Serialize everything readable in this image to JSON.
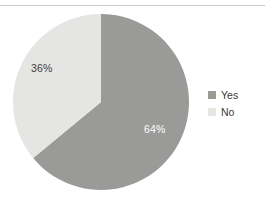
{
  "chart_data": {
    "type": "pie",
    "title": "",
    "subtitle": "",
    "xlabel": "",
    "ylabel": "",
    "grid": false,
    "legend_position": "right",
    "categories": [
      "Yes",
      "No"
    ],
    "values": [
      64,
      36
    ],
    "value_unit": "%",
    "start_angle_deg": 0,
    "direction": "clockwise",
    "slices": [
      {
        "name": "Yes",
        "value": 64,
        "label": "64%",
        "color": "#9a9a98",
        "label_color": "#ffffff"
      },
      {
        "name": "No",
        "value": 36,
        "label": "36%",
        "color": "#e5e5e3",
        "label_color": "#3d3d3d"
      }
    ],
    "legend": [
      {
        "label": "Yes",
        "color": "#9a9a98"
      },
      {
        "label": "No",
        "color": "#e5e5e3"
      }
    ]
  },
  "figure": {
    "background": "#ffffff",
    "rule_color": "#c9c9c9"
  }
}
